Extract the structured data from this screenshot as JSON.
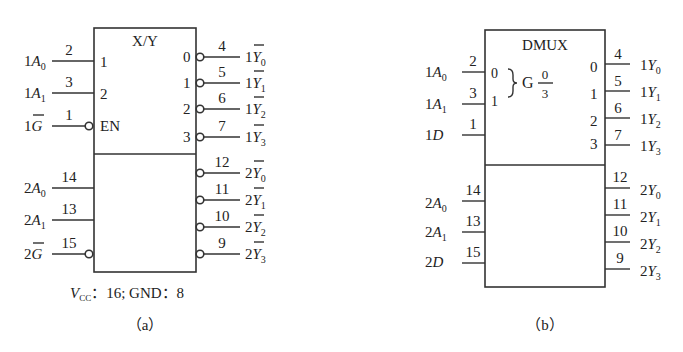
{
  "figure_a": {
    "caption": "（a）",
    "title": "X/Y",
    "power_note": {
      "vcc_label": "V",
      "vcc_sub": "CC",
      "rest": "：16;  GND：8"
    },
    "upper_inputs": [
      {
        "name": "1A",
        "sub": "0",
        "prefix": "1",
        "pin": "2",
        "inner": "1",
        "inverted": false
      },
      {
        "name": "1A",
        "sub": "1",
        "prefix": "1",
        "pin": "3",
        "inner": "2",
        "inverted": false
      },
      {
        "name": "1G",
        "sub": "",
        "prefix": "1",
        "pin": "1",
        "inner": "EN",
        "inverted": true
      }
    ],
    "lower_inputs": [
      {
        "name": "2A",
        "sub": "0",
        "prefix": "2",
        "pin": "14",
        "inverted": false
      },
      {
        "name": "2A",
        "sub": "1",
        "prefix": "2",
        "pin": "13",
        "inverted": false
      },
      {
        "name": "2G",
        "sub": "",
        "prefix": "2",
        "pin": "15",
        "inverted": true
      }
    ],
    "upper_outputs": [
      {
        "inner": "0",
        "pin": "4",
        "prefix": "1",
        "name": "Y",
        "sub": "0"
      },
      {
        "inner": "1",
        "pin": "5",
        "prefix": "1",
        "name": "Y",
        "sub": "1"
      },
      {
        "inner": "2",
        "pin": "6",
        "prefix": "1",
        "name": "Y",
        "sub": "2"
      },
      {
        "inner": "3",
        "pin": "7",
        "prefix": "1",
        "name": "Y",
        "sub": "3"
      }
    ],
    "lower_outputs": [
      {
        "pin": "12",
        "prefix": "2",
        "name": "Y",
        "sub": "0"
      },
      {
        "pin": "11",
        "prefix": "2",
        "name": "Y",
        "sub": "1"
      },
      {
        "pin": "10",
        "prefix": "2",
        "name": "Y",
        "sub": "2"
      },
      {
        "pin": "9",
        "prefix": "2",
        "name": "Y",
        "sub": "3"
      }
    ]
  },
  "figure_b": {
    "caption": "（b）",
    "title": "DMUX",
    "group_label": "G",
    "group_frac_num": "0",
    "group_frac_den": "3",
    "upper_inputs": [
      {
        "prefix": "1",
        "name": "A",
        "sub": "0",
        "pin": "2",
        "inner": "0"
      },
      {
        "prefix": "1",
        "name": "A",
        "sub": "1",
        "pin": "3",
        "inner": "1"
      },
      {
        "prefix": "1",
        "name": "D",
        "sub": "",
        "pin": "1",
        "inner": ""
      }
    ],
    "lower_inputs": [
      {
        "prefix": "2",
        "name": "A",
        "sub": "0",
        "pin": "14"
      },
      {
        "prefix": "2",
        "name": "A",
        "sub": "1",
        "pin": "13"
      },
      {
        "prefix": "2",
        "name": "D",
        "sub": "",
        "pin": "15"
      }
    ],
    "upper_outputs": [
      {
        "inner": "0",
        "pin": "4",
        "prefix": "1",
        "name": "Y",
        "sub": "0"
      },
      {
        "inner": "1",
        "pin": "5",
        "prefix": "1",
        "name": "Y",
        "sub": "1"
      },
      {
        "inner": "2",
        "pin": "6",
        "prefix": "1",
        "name": "Y",
        "sub": "2"
      },
      {
        "inner": "3",
        "pin": "7",
        "prefix": "1",
        "name": "Y",
        "sub": "3"
      }
    ],
    "lower_outputs": [
      {
        "pin": "12",
        "prefix": "2",
        "name": "Y",
        "sub": "0"
      },
      {
        "pin": "11",
        "prefix": "2",
        "name": "Y",
        "sub": "1"
      },
      {
        "pin": "10",
        "prefix": "2",
        "name": "Y",
        "sub": "2"
      },
      {
        "pin": "9",
        "prefix": "2",
        "name": "Y",
        "sub": "3"
      }
    ]
  }
}
